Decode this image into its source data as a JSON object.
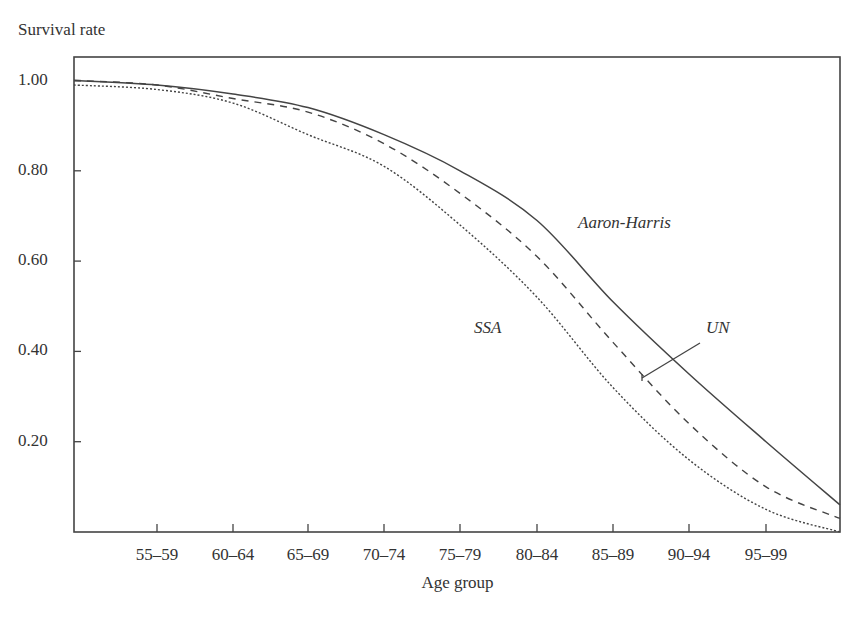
{
  "chart_data": {
    "type": "line",
    "title": "",
    "ylabel": "Survival rate",
    "xlabel": "Age group",
    "ylim": [
      0.0,
      1.05
    ],
    "grid": false,
    "legend": "inline labels",
    "yticks": [
      "1.00",
      "0.80",
      "0.60",
      "0.40",
      "0.20"
    ],
    "ytick_values": [
      1.0,
      0.8,
      0.6,
      0.4,
      0.2
    ],
    "categories": [
      "50–54",
      "55–59",
      "60–64",
      "65–69",
      "70–74",
      "75–79",
      "80–84",
      "85–89",
      "90–94",
      "95–99",
      "100+"
    ],
    "xtick_labels": [
      "55–59",
      "60–64",
      "65–69",
      "70–74",
      "75–79",
      "80–84",
      "85–89",
      "90–94",
      "95–99"
    ],
    "series": [
      {
        "name": "Aaron-Harris",
        "style": "solid",
        "values": [
          1.0,
          0.99,
          0.97,
          0.94,
          0.88,
          0.8,
          0.69,
          0.51,
          0.35,
          0.2,
          0.06
        ]
      },
      {
        "name": "UN",
        "style": "dashed",
        "values": [
          1.0,
          0.99,
          0.96,
          0.93,
          0.86,
          0.75,
          0.61,
          0.42,
          0.24,
          0.1,
          0.03
        ]
      },
      {
        "name": "SSA",
        "style": "dotted",
        "values": [
          0.99,
          0.98,
          0.95,
          0.88,
          0.81,
          0.68,
          0.52,
          0.32,
          0.16,
          0.05,
          0.0
        ]
      }
    ],
    "annotations": [
      {
        "text": "Aaron-Harris",
        "x": 578,
        "y": 226
      },
      {
        "text": "SSA",
        "x": 474,
        "y": 331
      },
      {
        "text": "UN",
        "x": 706,
        "y": 330
      }
    ]
  },
  "axis": {
    "y_title": "Survival rate",
    "x_title": "Age group"
  },
  "labels": {
    "aaron_harris": "Aaron-Harris",
    "ssa": "SSA",
    "un": "UN"
  }
}
